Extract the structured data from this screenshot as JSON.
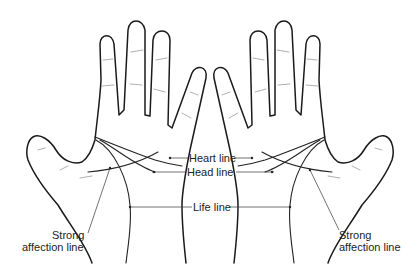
{
  "diagram": {
    "labels": {
      "heart_line": "Heart line",
      "head_line": "Head line",
      "life_line": "Life line",
      "strong_affection_left_1": "Strong",
      "strong_affection_left_2": "affection line",
      "strong_affection_right_1": "Strong",
      "strong_affection_right_2": "affection line"
    },
    "hands": [
      "left-hand",
      "right-hand"
    ],
    "colors": {
      "outline": "#1a1a1a",
      "crease": "#9a9a9a",
      "background": "#ffffff"
    }
  }
}
